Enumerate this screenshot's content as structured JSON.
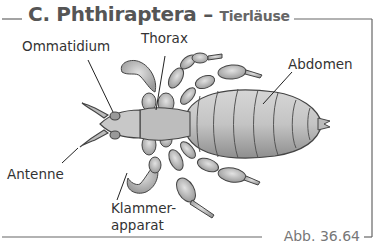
{
  "figure": {
    "section_letter": "C.",
    "title": "Phthiraptera",
    "separator": "–",
    "subtitle": "Tierläuse",
    "caption": "Abb. 36.64"
  },
  "labels": {
    "ommatidium": "Ommatidium",
    "thorax": "Thorax",
    "abdomen": "Abdomen",
    "antenne": "Antenne",
    "klammer_line1": "Klammer-",
    "klammer_line2": "apparat"
  },
  "colors": {
    "frame": "#555555",
    "body_fill": "#bdbdbd",
    "body_stroke": "#444444",
    "text": "#333333"
  }
}
